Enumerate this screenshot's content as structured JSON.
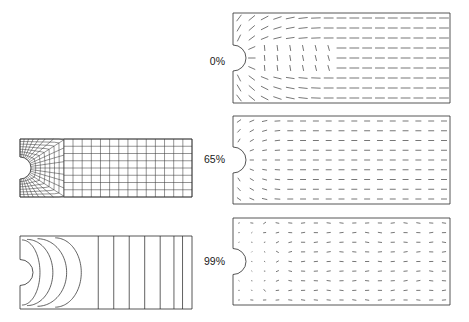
{
  "figure": {
    "background_color": "#ffffff",
    "line_color": "#2e2e2e",
    "vector_color": "#3c3c3c"
  },
  "labels": {
    "stage_0": "0%",
    "stage_65": "65%",
    "stage_99": "99%"
  },
  "panels": [
    {
      "id": "mesh-panel",
      "name": "finite-element-mesh",
      "kind": "mesh",
      "label": "",
      "x": 20,
      "y": 139,
      "width": 172,
      "height": 58,
      "notch_radius": 11,
      "notch_center_y_frac": 0.5,
      "fan_rays": 22,
      "fan_rings": 7,
      "grid_columns": 14,
      "grid_rows": 8,
      "transition_x_frac": 0.255
    },
    {
      "id": "contour-panel",
      "name": "stress-contour-plot",
      "kind": "contour",
      "label": "",
      "x": 20,
      "y": 236,
      "width": 172,
      "height": 73,
      "notch_radius": 13,
      "contour_count": 11,
      "curved_contours": 4,
      "straight_contours": 7
    },
    {
      "id": "vector-panel-0",
      "name": "vector-field-0-percent",
      "kind": "vector",
      "label": "0%",
      "label_x": 225,
      "label_y": 62,
      "x": 233,
      "y": 13,
      "width": 217,
      "height": 90,
      "notch_radius": 13,
      "stage": 0,
      "cols": 17,
      "rows": 9,
      "near_field_mode": "radial-fan",
      "arrow_scale": 1.0
    },
    {
      "id": "vector-panel-65",
      "name": "vector-field-65-percent",
      "kind": "vector",
      "label": "65%",
      "label_x": 225,
      "label_y": 160,
      "x": 233,
      "y": 116,
      "width": 217,
      "height": 88,
      "notch_radius": 13,
      "stage": 65,
      "cols": 17,
      "rows": 9,
      "near_field_mode": "horizontal-converging",
      "arrow_scale": 0.9
    },
    {
      "id": "vector-panel-99",
      "name": "vector-field-99-percent",
      "kind": "vector",
      "label": "99%",
      "label_x": 225,
      "label_y": 262,
      "x": 233,
      "y": 218,
      "width": 217,
      "height": 87,
      "notch_radius": 13,
      "stage": 99,
      "cols": 17,
      "rows": 9,
      "near_field_mode": "scattered-short",
      "arrow_scale": 0.72
    }
  ],
  "chart_data": {
    "type": "scatter",
    "xlabel": "",
    "ylabel": "",
    "series": [
      {
        "name": "0%",
        "description": "Vector field at 0% load: long horizontal vectors in the far field, strongly deflected fan around the notch, near-vertical vectors just downstream of the notch."
      },
      {
        "name": "65%",
        "description": "Vector field at 65% load: uniform horizontal vectors across most of the strip, compressed converging fan in the notch wake."
      },
      {
        "name": "99%",
        "description": "Vector field at 99% load: short, scattered vectors near the notch indicating localisation; far field remains horizontal but reduced in magnitude."
      }
    ],
    "legend_position": "left-of-panels",
    "grid": false
  }
}
